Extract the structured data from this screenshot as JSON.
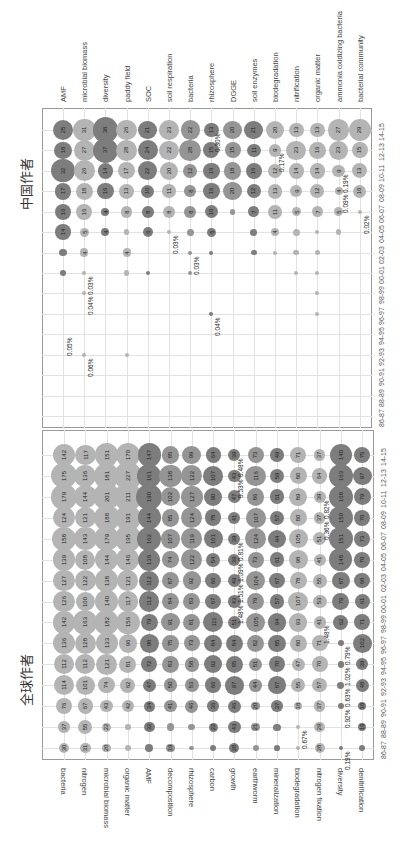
{
  "chart_data": [
    {
      "type": "bubble",
      "title": "中国作者",
      "orientation": "rotated-90",
      "x_categories": [
        "86-87",
        "88-89",
        "90-91",
        "92-93",
        "94-95",
        "96-97",
        "98-99",
        "00-01",
        "02-03",
        "04-05",
        "06-07",
        "08-09",
        "10-11",
        "12-13",
        "14-15"
      ],
      "rows": [
        {
          "name": "AMF",
          "values": [
            null,
            null,
            null,
            null,
            null,
            null,
            null,
            2,
            3,
            14,
            16,
            17,
            32,
            18,
            25
          ],
          "shade": "dark",
          "annotations": [
            {
              "x": "94-95",
              "text": "0.05%"
            }
          ]
        },
        {
          "name": "microbial biomass",
          "values": [
            null,
            null,
            null,
            1,
            null,
            null,
            1,
            1,
            4,
            5,
            16,
            18,
            26,
            27,
            31
          ],
          "shade": "light",
          "annotations": [
            {
              "x": "92-93",
              "text": "0.06%"
            },
            {
              "x": "98-99",
              "text": "0.04%"
            },
            {
              "x": "00-01",
              "text": "0.03%"
            }
          ]
        },
        {
          "name": "diversity",
          "values": [
            null,
            null,
            null,
            null,
            null,
            null,
            null,
            null,
            null,
            4,
            4,
            16,
            14,
            37,
            38
          ],
          "shade": "dark",
          "annotations": []
        },
        {
          "name": "paddy field",
          "values": [
            null,
            null,
            null,
            1,
            null,
            null,
            null,
            2,
            4,
            2,
            8,
            13,
            17,
            28,
            26
          ],
          "shade": "light",
          "annotations": []
        },
        {
          "name": "SOC",
          "values": [
            null,
            null,
            null,
            null,
            null,
            null,
            null,
            1,
            null,
            6,
            8,
            10,
            22,
            24,
            21
          ],
          "shade": "dark",
          "annotations": []
        },
        {
          "name": "soil respiration",
          "values": [
            null,
            null,
            null,
            null,
            null,
            null,
            null,
            null,
            null,
            1,
            8,
            11,
            20,
            22,
            23
          ],
          "shade": "light",
          "annotations": [
            {
              "x": "04-05",
              "text": "0.03%"
            }
          ]
        },
        {
          "name": "bacteria",
          "values": [
            null,
            null,
            null,
            null,
            null,
            null,
            null,
            1,
            1,
            3,
            8,
            8,
            12,
            28,
            22
          ],
          "shade": "mid",
          "annotations": [
            {
              "x": "02-03",
              "text": "0.03%"
            }
          ]
        },
        {
          "name": "rhizosphere",
          "values": [
            null,
            null,
            null,
            null,
            null,
            1,
            null,
            null,
            1,
            5,
            10,
            16,
            16,
            15,
            13
          ],
          "shade": "dark",
          "annotations": [
            {
              "x": "96-97",
              "text": "0.04%"
            },
            {
              "x": "14-15",
              "text": "0.30%"
            }
          ]
        },
        {
          "name": "DGGE",
          "values": [
            null,
            null,
            null,
            null,
            null,
            null,
            null,
            null,
            null,
            null,
            2,
            20,
            18,
            15,
            20
          ],
          "shade": "mid",
          "annotations": []
        },
        {
          "name": "soil enzymes",
          "values": [
            null,
            null,
            null,
            null,
            null,
            null,
            null,
            null,
            2,
            3,
            7,
            12,
            16,
            11,
            21
          ],
          "shade": "dark",
          "annotations": []
        },
        {
          "name": "biodegradation",
          "values": [
            null,
            null,
            null,
            null,
            null,
            null,
            null,
            null,
            1,
            4,
            11,
            13,
            12,
            9,
            20
          ],
          "shade": "light",
          "annotations": [
            {
              "x": "12-13",
              "text": "0.17%"
            }
          ]
        },
        {
          "name": "nitrification",
          "values": [
            null,
            null,
            null,
            null,
            null,
            null,
            null,
            1,
            2,
            3,
            5,
            9,
            14,
            23,
            13
          ],
          "shade": "light",
          "annotations": []
        },
        {
          "name": "organic matter",
          "values": [
            null,
            null,
            null,
            null,
            null,
            1,
            1,
            1,
            2,
            1,
            7,
            12,
            14,
            16,
            13
          ],
          "shade": "light",
          "annotations": []
        },
        {
          "name": "ammonia oxidizing bacteria",
          "values": [
            null,
            null,
            null,
            null,
            null,
            null,
            null,
            null,
            null,
            2,
            5,
            4,
            9,
            23,
            27
          ],
          "shade": "light",
          "annotations": [
            {
              "x": "08-09",
              "text": "0.09%"
            },
            {
              "x": "10-11",
              "text": "0.19%"
            }
          ]
        },
        {
          "name": "bacterial community",
          "values": [
            null,
            null,
            null,
            null,
            null,
            null,
            null,
            null,
            null,
            null,
            1,
            10,
            13,
            15,
            29
          ],
          "shade": "light",
          "annotations": [
            {
              "x": "06-07",
              "text": "0.02%"
            }
          ]
        }
      ]
    },
    {
      "type": "bubble",
      "title": "全球作者",
      "orientation": "rotated-90",
      "x_categories": [
        "86-87",
        "88-89",
        "90-91",
        "92-93",
        "94-95",
        "96-97",
        "98-99",
        "00-01",
        "02-03",
        "04-05",
        "06-07",
        "08-09",
        "10-11",
        "12-13",
        "14-15"
      ],
      "rows": [
        {
          "name": "bacteria",
          "values": [
            30,
            37,
            76,
            114,
            112,
            136,
            142,
            126,
            127,
            139,
            158,
            124,
            179,
            175,
            142
          ],
          "shade": "light",
          "annotations": []
        },
        {
          "name": "nitrogen",
          "values": [
            31,
            55,
            67,
            101,
            112,
            128,
            163,
            100,
            122,
            108,
            143,
            121,
            144,
            136,
            117
          ],
          "shade": "light",
          "annotations": []
        },
        {
          "name": "microbial biomass",
          "values": [
            20,
            22,
            43,
            74,
            121,
            133,
            182,
            140,
            138,
            144,
            179,
            188,
            201,
            181,
            151
          ],
          "shade": "light",
          "annotations": []
        },
        {
          "name": "organic matter",
          "values": [
            10,
            9,
            42,
            62,
            81,
            96,
            156,
            117,
            121,
            146,
            195,
            191,
            211,
            227,
            170
          ],
          "shade": "light",
          "annotations": []
        },
        {
          "name": "AMF",
          "values": [
            17,
            32,
            34,
            47,
            72,
            98,
            79,
            112,
            112,
            136,
            162,
            144,
            190,
            161,
            147
          ],
          "shade": "dark",
          "annotations": []
        },
        {
          "name": "decomposition",
          "values": [
            19,
            17,
            41,
            50,
            83,
            75,
            91,
            84,
            87,
            74,
            107,
            85,
            102,
            138,
            85
          ],
          "shade": "mid",
          "annotations": []
        },
        {
          "name": "rhizosphere",
          "values": [
            6,
            13,
            46,
            53,
            58,
            73,
            81,
            83,
            92,
            122,
            119,
            124,
            127,
            122,
            99
          ],
          "shade": "mid",
          "annotations": []
        },
        {
          "name": "carbon",
          "values": [
            10,
            22,
            36,
            66,
            92,
            84,
            111,
            67,
            66,
            54,
            101,
            78,
            90,
            107,
            64
          ],
          "shade": "dark",
          "annotations": []
        },
        {
          "name": "growth",
          "values": [
            28,
            43,
            46,
            97,
            85,
            84,
            51,
            43,
            49,
            39,
            39,
            41,
            47,
            43,
            39
          ],
          "shade": "dark",
          "annotations": [
            {
              "x": "00-01",
              "text": "1.48%"
            },
            {
              "x": "02-03",
              "text": "1.51%"
            },
            {
              "x": "04-05",
              "text": "1.09%"
            },
            {
              "x": "06-07",
              "text": "0.81%"
            },
            {
              "x": "12-13",
              "text": "0.53%"
            },
            {
              "x": "14-15",
              "text": "0.48%"
            }
          ]
        },
        {
          "name": "earthworm",
          "values": [
            11,
            21,
            20,
            44,
            51,
            82,
            105,
            79,
            104,
            73,
            124,
            107,
            86,
            116,
            73
          ],
          "shade": "mid",
          "annotations": []
        },
        {
          "name": "mineralization",
          "values": [
            9,
            14,
            37,
            87,
            70,
            85,
            94,
            57,
            67,
            61,
            94,
            57,
            61,
            59,
            49
          ],
          "shade": "dark",
          "annotations": []
        },
        {
          "name": "biodegradation",
          "values": [
            2,
            5,
            18,
            55,
            47,
            80,
            93,
            107,
            78,
            98,
            105,
            80,
            89,
            80,
            71
          ],
          "shade": "light",
          "annotations": [
            {
              "x": "88-89",
              "text": "0.67%"
            }
          ]
        },
        {
          "name": "nitrogen fixation",
          "values": [
            28,
            29,
            37,
            57,
            70,
            71,
            41,
            53,
            55,
            41,
            51,
            37,
            39,
            64,
            37
          ],
          "shade": "light",
          "annotations": [
            {
              "x": "98-99",
              "text": "1.48%"
            },
            {
              "x": "08-09",
              "text": "0.36%"
            },
            {
              "x": "10-11",
              "text": "0.82%"
            }
          ]
        },
        {
          "name": "diversity",
          "values": [
            1,
            null,
            11,
            13,
            12,
            10,
            62,
            79,
            87,
            148,
            151,
            150,
            168,
            163,
            140
          ],
          "shade": "dark",
          "annotations": [
            {
              "x": "86-87",
              "text": "0.19%"
            },
            {
              "x": "90-91",
              "text": "0.92%"
            },
            {
              "x": "92-93",
              "text": "0.63%"
            },
            {
              "x": "94-95",
              "text": "1.02%"
            },
            {
              "x": "96-97",
              "text": "0.79%"
            }
          ]
        },
        {
          "name": "denitrification",
          "values": [
            11,
            19,
            18,
            48,
            39,
            102,
            71,
            61,
            68,
            70,
            73,
            70,
            79,
            97,
            75
          ],
          "shade": "dark",
          "annotations": []
        }
      ]
    }
  ],
  "panels": {
    "top": {
      "title": "中国作者"
    },
    "bottom": {
      "title": "全球作者"
    }
  },
  "colors": {
    "dark": "#7d7d7d",
    "mid": "#959595",
    "light": "#b4b4b4",
    "grid": "#e2e2e2",
    "frame": "#9a9a9a"
  }
}
